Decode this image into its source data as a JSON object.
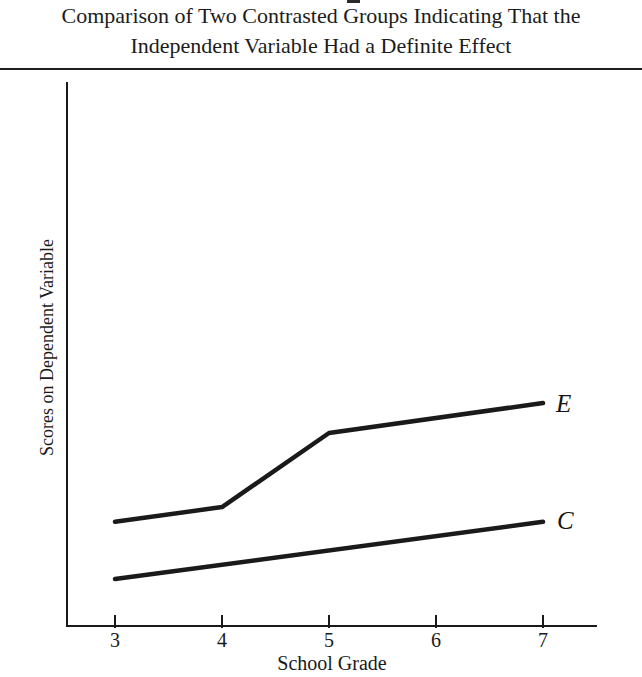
{
  "title": {
    "line1": "Comparison of Two Contrasted Groups Indicating That the",
    "line2": "Independent Variable Had a Definite Effect"
  },
  "chart_data": {
    "type": "line",
    "title": "Comparison of Two Contrasted Groups Indicating That the Independent Variable Had a Definite Effect",
    "xlabel": "School Grade",
    "ylabel": "Scores on Dependent Variable",
    "categories": [
      "3",
      "4",
      "5",
      "6",
      "7"
    ],
    "x_range": [
      3,
      7
    ],
    "y_axis_note": "y-axis has no tick labels; y values are relative heights where 0 = x-axis baseline and 100 = top of y-axis",
    "grid": false,
    "legend": "inline italic labels at right end of each line",
    "series": [
      {
        "name": "E",
        "label": "E",
        "points": [
          {
            "x": 3,
            "y": 19.3
          },
          {
            "x": 4,
            "y": 22.0
          },
          {
            "x": 5,
            "y": 35.6
          },
          {
            "x": 7,
            "y": 41.1
          }
        ]
      },
      {
        "name": "C",
        "label": "C",
        "points": [
          {
            "x": 3,
            "y": 8.8
          },
          {
            "x": 7,
            "y": 19.3
          }
        ]
      }
    ],
    "line_color": "#1a1a1a",
    "background_color": "#ffffff"
  }
}
